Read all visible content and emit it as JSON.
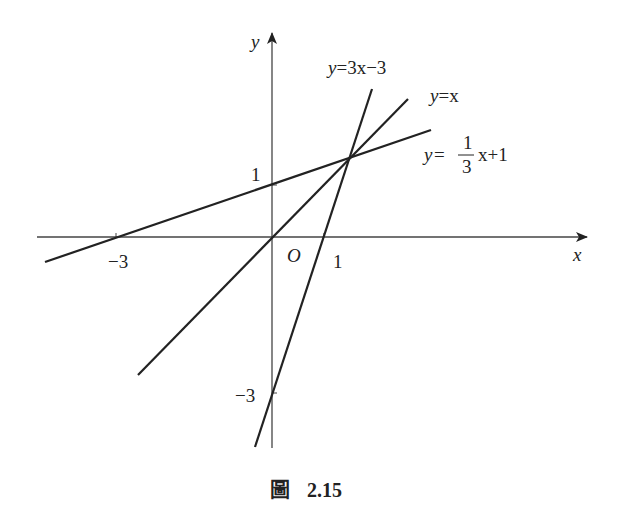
{
  "figure": {
    "caption_prefix": "圖",
    "caption_number": "2.15",
    "axes": {
      "x_label": "x",
      "y_label": "y",
      "origin_label": "O",
      "ticks": {
        "x_neg3": "−3",
        "x_1": "1",
        "y_1": "1",
        "y_neg3": "−3"
      }
    },
    "lines": [
      {
        "name": "y=3x−3",
        "label_y": "y",
        "label_rest": "=3x−3"
      },
      {
        "name": "y=x",
        "label_y": "y",
        "label_rest": "=x"
      },
      {
        "name": "y=1/3 x+1",
        "label_y": "y",
        "label_eq": "=",
        "frac_num": "1",
        "frac_den": "3",
        "label_rest": "x+1"
      }
    ],
    "intersection": "(3/2, 3/2)",
    "colors": {
      "line": "#222222",
      "axis": "#444444"
    }
  }
}
